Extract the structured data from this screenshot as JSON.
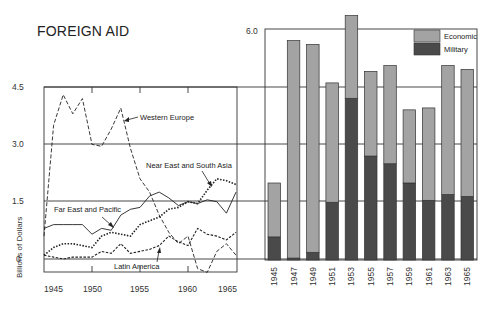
{
  "title": "FOREIGN AID",
  "chart_data": [
    {
      "type": "line",
      "title": "FOREIGN AID",
      "xlabel": "",
      "ylabel": "Billions of Dollars",
      "ylim": [
        -0.35,
        4.5
      ],
      "xlim": [
        1945,
        1966
      ],
      "grid": true,
      "x_ticks": [
        "1945",
        "1950",
        "1955",
        "1960",
        "1965"
      ],
      "y_ticks": [
        "0",
        "1.5",
        "3.0",
        "4.5"
      ],
      "x": [
        1945,
        1946,
        1947,
        1948,
        1949,
        1950,
        1951,
        1952,
        1953,
        1954,
        1955,
        1956,
        1957,
        1958,
        1959,
        1960,
        1961,
        1962,
        1963,
        1964,
        1965
      ],
      "series": [
        {
          "name": "Western Europe",
          "style": "dashed",
          "values": [
            0.6,
            3.5,
            4.3,
            3.8,
            4.2,
            3.0,
            2.95,
            3.4,
            3.95,
            2.9,
            2.1,
            1.75,
            1.15,
            0.7,
            0.4,
            0.6,
            -0.25,
            -0.35,
            0.2,
            0.4,
            0.1
          ]
        },
        {
          "name": "Near East and South Asia",
          "style": "dotted",
          "values": [
            0.1,
            0.3,
            0.4,
            0.4,
            0.35,
            0.3,
            0.6,
            0.7,
            0.65,
            0.6,
            0.9,
            1.0,
            1.1,
            1.3,
            1.35,
            1.5,
            1.45,
            1.8,
            2.1,
            2.05,
            1.95
          ]
        },
        {
          "name": "Far East and Pacific",
          "style": "solid",
          "values": [
            0.8,
            0.9,
            0.9,
            0.9,
            0.9,
            0.65,
            0.8,
            0.75,
            1.15,
            1.3,
            1.35,
            1.65,
            1.75,
            1.6,
            1.4,
            1.5,
            1.45,
            1.55,
            1.5,
            1.2,
            1.75
          ]
        },
        {
          "name": "Latin America",
          "style": "dashed-fine",
          "values": [
            0.1,
            0.05,
            0.0,
            0.05,
            0.05,
            0.05,
            0.2,
            0.15,
            0.4,
            0.15,
            0.2,
            0.25,
            0.35,
            0.6,
            0.45,
            0.35,
            0.8,
            0.65,
            0.6,
            0.5,
            0.7
          ]
        }
      ],
      "annotations": [
        "Western Europe",
        "Near East and South Asia",
        "Far East and Pacific",
        "Latin America"
      ]
    },
    {
      "type": "bar",
      "stacked": true,
      "ylim": [
        0,
        6.0
      ],
      "y_ticks": [
        "6.0"
      ],
      "categories": [
        "1945",
        "1947",
        "1949",
        "1951",
        "1953",
        "1955",
        "1957",
        "1959",
        "1961",
        "1963",
        "1965"
      ],
      "series": [
        {
          "name": "Military",
          "color": "#4a4a4a",
          "values": [
            0.6,
            0.05,
            0.2,
            1.5,
            4.2,
            2.7,
            2.5,
            2.0,
            1.55,
            1.7,
            1.65
          ]
        },
        {
          "name": "Economic",
          "color": "#a3a3a3",
          "values": [
            1.4,
            5.65,
            5.4,
            3.1,
            2.15,
            2.2,
            2.55,
            1.9,
            2.4,
            3.35,
            3.3
          ]
        }
      ],
      "totals": [
        2.0,
        5.7,
        5.6,
        4.6,
        6.35,
        4.9,
        5.05,
        3.9,
        3.95,
        5.05,
        4.95
      ],
      "legend": {
        "position": "top-right",
        "entries": [
          "Economic",
          "Military"
        ]
      }
    }
  ],
  "labels": {
    "ylabel": "Billions of Dollars",
    "y_ticks": [
      "4.5",
      "3.0",
      "1.5",
      "0"
    ],
    "x_ticks": [
      "1945",
      "1950",
      "1955",
      "1960",
      "1965"
    ],
    "right_top_tick": "6.0",
    "legend_economic": "Economic",
    "legend_military": "Military",
    "anno_we": "Western Europe",
    "anno_ne": "Near East and South Asia",
    "anno_fe": "Far East and Pacific",
    "anno_la": "Latin America"
  },
  "colors": {
    "economic": "#a3a3a3",
    "military": "#4a4a4a",
    "line": "#222222",
    "grid": "#333333"
  }
}
